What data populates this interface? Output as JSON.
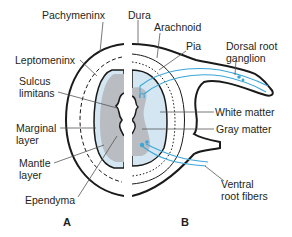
{
  "diagram": {
    "type": "anatomical-cross-section",
    "colors": {
      "outline": "#1a1a1a",
      "gray_matter": "#b9bcc0",
      "white_matter": "#d3e6f2",
      "panel_b_fill": "#bcdcee",
      "nerve_fiber": "#3aa6d8",
      "leader_line": "#6d6e70",
      "background": "#ffffff"
    },
    "panels": [
      {
        "id": "A",
        "label": "A"
      },
      {
        "id": "B",
        "label": "B"
      }
    ],
    "labels_left": [
      {
        "id": "pachymeninx",
        "text": "Pachymeninx"
      },
      {
        "id": "leptomeninx",
        "text": "Leptomeninx"
      },
      {
        "id": "sulcus-limitans-1",
        "text": "Sulcus"
      },
      {
        "id": "sulcus-limitans-2",
        "text": "limitans"
      },
      {
        "id": "marginal-layer-1",
        "text": "Marginal"
      },
      {
        "id": "marginal-layer-2",
        "text": "layer"
      },
      {
        "id": "mantle-layer-1",
        "text": "Mantle"
      },
      {
        "id": "mantle-layer-2",
        "text": "layer"
      },
      {
        "id": "ependyma",
        "text": "Ependyma"
      }
    ],
    "labels_right": [
      {
        "id": "dura",
        "text": "Dura"
      },
      {
        "id": "arachnoid",
        "text": "Arachnoid"
      },
      {
        "id": "pia",
        "text": "Pia"
      },
      {
        "id": "dorsal-root-ganglion-1",
        "text": "Dorsal root"
      },
      {
        "id": "dorsal-root-ganglion-2",
        "text": "ganglion"
      },
      {
        "id": "white-matter",
        "text": "White matter"
      },
      {
        "id": "gray-matter",
        "text": "Gray matter"
      },
      {
        "id": "ventral-root-fibers-1",
        "text": "Ventral"
      },
      {
        "id": "ventral-root-fibers-2",
        "text": "root fibers"
      }
    ]
  }
}
